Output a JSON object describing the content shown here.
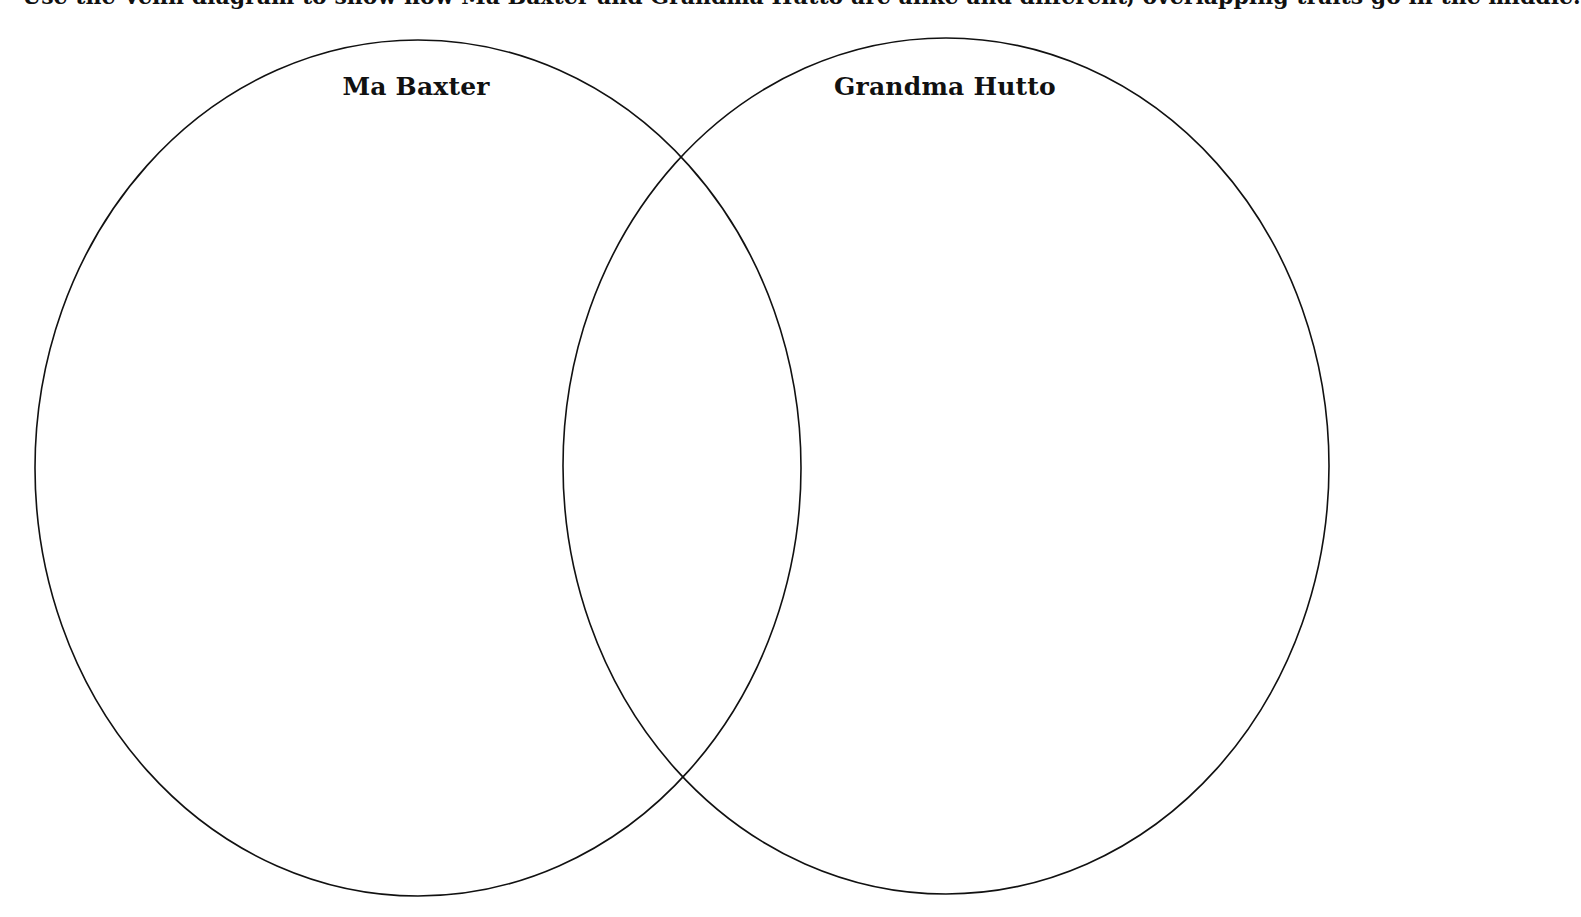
{
  "diagram": {
    "type": "venn",
    "cropped_instruction_text": "Use the Venn diagram to show how Ma Baxter and Grandma Hutto are alike and different, overlapping traits go in the middle.",
    "colors": {
      "stroke": "#111111",
      "background": "#ffffff",
      "text": "#111111"
    },
    "sets": [
      {
        "label": "Ma Baxter",
        "ellipse": {
          "cx": 418,
          "cy": 468,
          "rx": 383,
          "ry": 428
        },
        "contents": []
      },
      {
        "label": "Grandma Hutto",
        "ellipse": {
          "cx": 946,
          "cy": 466,
          "rx": 383,
          "ry": 428
        },
        "contents": []
      }
    ],
    "overlap": {
      "label": "",
      "contents": []
    }
  }
}
